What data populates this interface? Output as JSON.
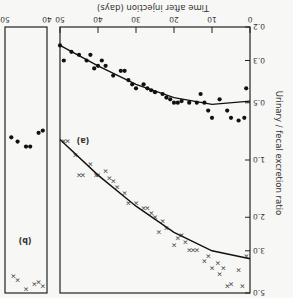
{
  "chart_data": [
    {
      "panel": "(a)",
      "type": "scatter",
      "title": "",
      "xlabel": "Time after injection (days)",
      "ylabel": "Urinary / fecal excretion ratio",
      "x_ticks": [
        0,
        10,
        20,
        30,
        40,
        50
      ],
      "y_ticks": [
        "0.2",
        "0.3",
        "0.5",
        "1.0",
        "2.0",
        "3.0",
        "5.0"
      ],
      "y_scale": "log",
      "xlim": [
        0,
        50
      ],
      "ylim": [
        0.2,
        5.0
      ],
      "orientation_note": "image rendered rotated 180 degrees",
      "series": [
        {
          "name": "dots",
          "marker": "circle",
          "points": [
            [
              1,
              0.42
            ],
            [
              1.5,
              0.6
            ],
            [
              3,
              0.62
            ],
            [
              5,
              0.6
            ],
            [
              6,
              0.55
            ],
            [
              8,
              0.48
            ],
            [
              10,
              0.6
            ],
            [
              11,
              0.55
            ],
            [
              12,
              0.5
            ],
            [
              13,
              0.45
            ],
            [
              14,
              0.5
            ],
            [
              16,
              0.5
            ],
            [
              18,
              0.49
            ],
            [
              19,
              0.5
            ],
            [
              20,
              0.5
            ],
            [
              21,
              0.48
            ],
            [
              22,
              0.47
            ],
            [
              23,
              0.45
            ],
            [
              25,
              0.44
            ],
            [
              26,
              0.43
            ],
            [
              27,
              0.42
            ],
            [
              28,
              0.4
            ],
            [
              30,
              0.42
            ],
            [
              31,
              0.4
            ],
            [
              32,
              0.38
            ],
            [
              33,
              0.34
            ],
            [
              34,
              0.34
            ],
            [
              36,
              0.36
            ],
            [
              38,
              0.32
            ],
            [
              39,
              0.3
            ],
            [
              40,
              0.32
            ],
            [
              41,
              0.33
            ],
            [
              42,
              0.28
            ],
            [
              43,
              0.3
            ],
            [
              45,
              0.28
            ],
            [
              47,
              0.27
            ],
            [
              49,
              0.3
            ],
            [
              50,
              0.25
            ]
          ],
          "fit": [
            [
              0,
              0.49
            ],
            [
              10,
              0.51
            ],
            [
              20,
              0.47
            ],
            [
              30,
              0.4
            ],
            [
              40,
              0.32
            ],
            [
              50,
              0.25
            ]
          ]
        },
        {
          "name": "crosses",
          "marker": "x",
          "points": [
            [
              1,
              3.2
            ],
            [
              2,
              4.6
            ],
            [
              3,
              3.8
            ],
            [
              5,
              4.5
            ],
            [
              6,
              4.6
            ],
            [
              7,
              3.7
            ],
            [
              8,
              4.0
            ],
            [
              8.5,
              3.5
            ],
            [
              10,
              3.7
            ],
            [
              11,
              3.2
            ],
            [
              12,
              3.4
            ],
            [
              14,
              3.0
            ],
            [
              15,
              3.0
            ],
            [
              16,
              3.0
            ],
            [
              17,
              2.7
            ],
            [
              18,
              2.5
            ],
            [
              19,
              2.6
            ],
            [
              20,
              2.8
            ],
            [
              22,
              2.3
            ],
            [
              23,
              2.1
            ],
            [
              24,
              2.4
            ],
            [
              25,
              2.0
            ],
            [
              26,
              1.9
            ],
            [
              27,
              1.8
            ],
            [
              28,
              1.8
            ],
            [
              30,
              1.7
            ],
            [
              32,
              1.7
            ],
            [
              33,
              1.5
            ],
            [
              35,
              1.4
            ],
            [
              36,
              1.3
            ],
            [
              37,
              1.25
            ],
            [
              38,
              1.15
            ],
            [
              40,
              1.2
            ],
            [
              40.5,
              1.2
            ],
            [
              42,
              1.05
            ],
            [
              44,
              1.2
            ],
            [
              45,
              1.2
            ],
            [
              46,
              0.95
            ],
            [
              48,
              0.8
            ],
            [
              49,
              0.8
            ]
          ],
          "fit": [
            [
              0,
              3.3
            ],
            [
              10,
              3.0
            ],
            [
              20,
              2.4
            ],
            [
              30,
              1.75
            ],
            [
              40,
              1.2
            ],
            [
              50,
              0.78
            ]
          ]
        }
      ],
      "annotation": "(a)"
    },
    {
      "panel": "(b)",
      "type": "scatter",
      "x_ticks": [
        40,
        50
      ],
      "xlim": [
        40,
        50
      ],
      "ylim": [
        0.2,
        5.0
      ],
      "series": [
        {
          "name": "dots",
          "marker": "circle",
          "points": [
            [
              41,
              0.7
            ],
            [
              42,
              0.72
            ],
            [
              44,
              0.85
            ],
            [
              45,
              0.85
            ],
            [
              47,
              0.8
            ],
            [
              48.5,
              0.76
            ]
          ]
        },
        {
          "name": "crosses",
          "marker": "x",
          "points": [
            [
              41,
              4.6
            ],
            [
              42,
              4.4
            ],
            [
              43,
              4.5
            ],
            [
              45,
              4.8
            ],
            [
              47,
              4.3
            ],
            [
              48,
              4.1
            ]
          ]
        }
      ],
      "annotation": "(b)"
    }
  ],
  "labels": {
    "xlabel": "Time after injection (days)",
    "ylabel": "Urinary / fecal excretion ratio",
    "panel_a": "(a)",
    "panel_b": "(b)",
    "xticks_a": [
      "0",
      "10",
      "20",
      "30",
      "40",
      "50"
    ],
    "xticks_b": [
      "40",
      "50"
    ],
    "yticks": [
      "0.2",
      "0.3",
      "0.5",
      "1.0",
      "2.0",
      "3.0",
      "5.0"
    ]
  }
}
